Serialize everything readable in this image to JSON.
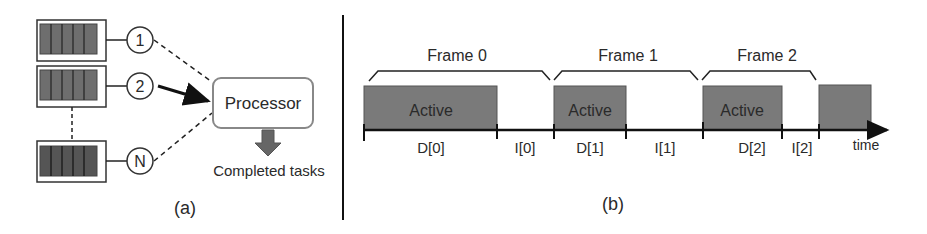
{
  "panel_a": {
    "caption": "(a)",
    "queues": [
      {
        "label": "1",
        "link": "dashed"
      },
      {
        "label": "2",
        "link": "solid-arrow"
      },
      {
        "label": "N",
        "link": "dashed"
      }
    ],
    "processor_label": "Processor",
    "output_label": "Completed tasks"
  },
  "panel_b": {
    "caption": "(b)",
    "frames": [
      {
        "label": "Frame 0"
      },
      {
        "label": "Frame 1"
      },
      {
        "label": "Frame 2"
      }
    ],
    "active_label": "Active",
    "segments": {
      "d0": "D[0]",
      "i0": "I[0]",
      "d1": "D[1]",
      "i1": "I[1]",
      "d2": "D[2]",
      "i2": "I[2]"
    },
    "axis_label": "time"
  },
  "colors": {
    "active_fill": "#7a7a7a",
    "queue_fill": "#6e6e6e",
    "line": "#1a1a1a"
  }
}
